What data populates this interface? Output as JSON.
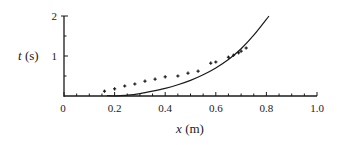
{
  "chart_data": {
    "type": "scatter",
    "title": "",
    "xlabel_var": "x",
    "xlabel_unit": " (m)",
    "ylabel_var": "t",
    "ylabel_unit": " (s)",
    "xlim": [
      0,
      1.0
    ],
    "ylim": [
      0,
      2
    ],
    "x_ticks": [
      {
        "value": 0,
        "label": "0"
      },
      {
        "value": 0.2,
        "label": "0.2"
      },
      {
        "value": 0.4,
        "label": "0.4"
      },
      {
        "value": 0.6,
        "label": "0.6"
      },
      {
        "value": 0.8,
        "label": "0.8"
      },
      {
        "value": 1.0,
        "label": "1.0"
      }
    ],
    "x_minor_step": 0.05,
    "y_ticks": [
      {
        "value": 1,
        "label": "1"
      },
      {
        "value": 2,
        "label": "2"
      }
    ],
    "y_minor_step": 0.5,
    "grid": false,
    "legend": null,
    "series": [
      {
        "name": "measured",
        "type": "scatter",
        "marker": "cross",
        "x": [
          0.16,
          0.2,
          0.24,
          0.28,
          0.32,
          0.36,
          0.4,
          0.45,
          0.49,
          0.53,
          0.58,
          0.6,
          0.65,
          0.67,
          0.69,
          0.7,
          0.72
        ],
        "y": [
          0.12,
          0.18,
          0.25,
          0.3,
          0.37,
          0.42,
          0.48,
          0.5,
          0.57,
          0.62,
          0.82,
          0.85,
          0.97,
          1.02,
          1.08,
          1.12,
          1.2
        ]
      },
      {
        "name": "model",
        "type": "line",
        "x": [
          0.2,
          0.25,
          0.3,
          0.35,
          0.4,
          0.45,
          0.5,
          0.55,
          0.6,
          0.65,
          0.7,
          0.75,
          0.81
        ],
        "y": [
          0.0,
          0.02,
          0.06,
          0.12,
          0.19,
          0.28,
          0.39,
          0.53,
          0.7,
          0.91,
          1.18,
          1.52,
          2.0
        ]
      }
    ]
  },
  "axis_labels": {
    "x_var": "x",
    "x_unit": " (m)",
    "y_var": "t",
    "y_unit": " (s)"
  }
}
